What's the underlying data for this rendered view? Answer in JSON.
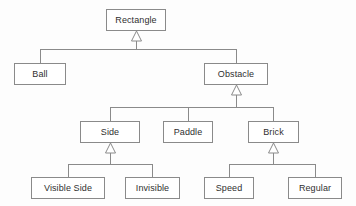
{
  "diagram": {
    "type": "uml-class-diagram",
    "relationship_kind": "generalization",
    "arrowhead": "hollow-triangle",
    "colors": {
      "background": "#fdfdfd",
      "box_fill": "#ffffff",
      "box_border": "#8a8a8a",
      "edge_line": "#8a8a8a",
      "text": "#2f2f2f"
    },
    "nodes": [
      {
        "id": "rectangle",
        "label": "Rectangle",
        "x": 106,
        "y": 9,
        "w": 60,
        "h": 22,
        "tier": 1
      },
      {
        "id": "ball",
        "label": "Ball",
        "x": 14,
        "y": 63,
        "w": 52,
        "h": 22,
        "tier": 2
      },
      {
        "id": "obstacle",
        "label": "Obstacle",
        "x": 204,
        "y": 63,
        "w": 64,
        "h": 22,
        "tier": 2
      },
      {
        "id": "side",
        "label": "Side",
        "x": 80,
        "y": 121,
        "w": 60,
        "h": 22,
        "tier": 3
      },
      {
        "id": "paddle",
        "label": "Paddle",
        "x": 163,
        "y": 121,
        "w": 50,
        "h": 22,
        "tier": 3
      },
      {
        "id": "brick",
        "label": "Brick",
        "x": 248,
        "y": 121,
        "w": 51,
        "h": 22,
        "tier": 3
      },
      {
        "id": "visible_side",
        "label": "Visible Side",
        "x": 31,
        "y": 177,
        "w": 74,
        "h": 22,
        "tier": 4
      },
      {
        "id": "invisible",
        "label": "Invisible",
        "x": 125,
        "y": 177,
        "w": 55,
        "h": 22,
        "tier": 4
      },
      {
        "id": "speed",
        "label": "Speed",
        "x": 204,
        "y": 177,
        "w": 50,
        "h": 22,
        "tier": 4
      },
      {
        "id": "regular",
        "label": "Regular",
        "x": 288,
        "y": 177,
        "w": 54,
        "h": 22,
        "tier": 4
      }
    ],
    "edges": [
      {
        "child": "ball",
        "parent": "rectangle",
        "label": "Ball inherits Rectangle"
      },
      {
        "child": "obstacle",
        "parent": "rectangle",
        "label": "Obstacle inherits Rectangle"
      },
      {
        "child": "side",
        "parent": "obstacle",
        "label": "Side inherits Obstacle"
      },
      {
        "child": "paddle",
        "parent": "obstacle",
        "label": "Paddle inherits Obstacle"
      },
      {
        "child": "brick",
        "parent": "obstacle",
        "label": "Brick inherits Obstacle"
      },
      {
        "child": "visible_side",
        "parent": "side",
        "label": "Visible Side inherits Side"
      },
      {
        "child": "invisible",
        "parent": "side",
        "label": "Invisible inherits Side"
      },
      {
        "child": "speed",
        "parent": "brick",
        "label": "Speed inherits Brick"
      },
      {
        "child": "regular",
        "parent": "brick",
        "label": "Regular inherits Brick"
      }
    ],
    "edge_groups": [
      {
        "id": "group-rectangle",
        "parent": "rectangle",
        "bar_y": 49,
        "bar_x1": 40,
        "bar_x2": 236,
        "arrow_x": 136,
        "arrow_tip_y": 31,
        "arrow_base_y": 41,
        "children_x": [
          40,
          236
        ],
        "children_top_y": 63
      },
      {
        "id": "group-obstacle",
        "parent": "obstacle",
        "bar_y": 107,
        "bar_x1": 110,
        "bar_x2": 273,
        "arrow_x": 236,
        "arrow_tip_y": 85,
        "arrow_base_y": 95,
        "children_x": [
          110,
          188,
          273
        ],
        "children_top_y": 121
      },
      {
        "id": "group-side",
        "parent": "side",
        "bar_y": 164,
        "bar_x1": 68,
        "bar_x2": 152,
        "arrow_x": 110,
        "arrow_tip_y": 143,
        "arrow_base_y": 153,
        "children_x": [
          68,
          152
        ],
        "children_top_y": 177
      },
      {
        "id": "group-brick",
        "parent": "brick",
        "bar_y": 164,
        "bar_x1": 229,
        "bar_x2": 315,
        "arrow_x": 273,
        "arrow_tip_y": 143,
        "arrow_base_y": 153,
        "children_x": [
          229,
          315
        ],
        "children_top_y": 177
      }
    ]
  }
}
